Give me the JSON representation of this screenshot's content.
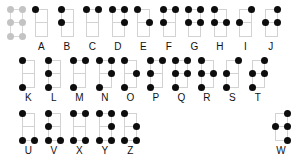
{
  "chart": {
    "dot_positions": [
      "1",
      "2",
      "3",
      "4",
      "5",
      "6"
    ],
    "reference_cell": {
      "label": "",
      "dots": [
        1,
        2,
        3,
        4,
        5,
        6
      ],
      "style": "reference-grid"
    },
    "colors": {
      "dot_on": "#0d0d0d",
      "dot_reference": "#c3c3c3",
      "rail": "#d2d2d2",
      "background": "#ffffff",
      "caption": "#111111"
    },
    "rows": [
      {
        "name": "row-1",
        "cells": [
          {
            "label": "A",
            "dots": [
              1
            ]
          },
          {
            "label": "B",
            "dots": [
              1,
              2
            ]
          },
          {
            "label": "C",
            "dots": [
              1,
              4
            ]
          },
          {
            "label": "D",
            "dots": [
              1,
              4,
              5
            ]
          },
          {
            "label": "E",
            "dots": [
              1,
              5
            ]
          },
          {
            "label": "F",
            "dots": [
              1,
              2,
              4
            ]
          },
          {
            "label": "G",
            "dots": [
              1,
              2,
              4,
              5
            ]
          },
          {
            "label": "H",
            "dots": [
              1,
              2,
              5
            ]
          },
          {
            "label": "I",
            "dots": [
              2,
              4
            ]
          },
          {
            "label": "J",
            "dots": [
              2,
              4,
              5
            ]
          }
        ]
      },
      {
        "name": "row-2",
        "cells": [
          {
            "label": "K",
            "dots": [
              1,
              3
            ]
          },
          {
            "label": "L",
            "dots": [
              1,
              2,
              3
            ]
          },
          {
            "label": "M",
            "dots": [
              1,
              3,
              4
            ]
          },
          {
            "label": "N",
            "dots": [
              1,
              3,
              4,
              5
            ]
          },
          {
            "label": "O",
            "dots": [
              1,
              3,
              5
            ]
          },
          {
            "label": "P",
            "dots": [
              1,
              2,
              3,
              4
            ]
          },
          {
            "label": "Q",
            "dots": [
              1,
              2,
              3,
              4,
              5
            ]
          },
          {
            "label": "R",
            "dots": [
              1,
              2,
              3,
              5
            ]
          },
          {
            "label": "S",
            "dots": [
              2,
              3,
              4
            ]
          },
          {
            "label": "T",
            "dots": [
              2,
              3,
              4,
              5
            ]
          }
        ]
      },
      {
        "name": "row-3",
        "cells": [
          {
            "label": "U",
            "dots": [
              1,
              3,
              6
            ]
          },
          {
            "label": "V",
            "dots": [
              1,
              2,
              3,
              6
            ]
          },
          {
            "label": "X",
            "dots": [
              1,
              3,
              4,
              6
            ]
          },
          {
            "label": "Y",
            "dots": [
              1,
              3,
              4,
              5,
              6
            ]
          },
          {
            "label": "Z",
            "dots": [
              1,
              3,
              5,
              6
            ]
          }
        ]
      }
    ],
    "trailing_cell": {
      "label": "W",
      "dots": [
        2,
        4,
        5,
        6
      ]
    }
  }
}
